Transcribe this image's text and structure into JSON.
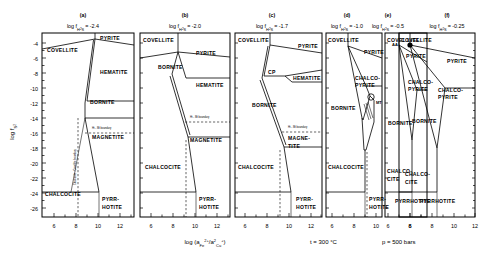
{
  "figure": {
    "axis": {
      "ylabel": "log f",
      "ylabel_sub": "S",
      "ylabel_sub2": "2",
      "ylabel_full": "log f_S2",
      "xlabel_full": "log (a_Fe2+ / a²_Cu+)",
      "xlabel_p1": "log (a",
      "xlabel_sub1": "Fe",
      "xlabel_sup1": "2+",
      "xlabel_p2": "/a",
      "xlabel_sup2": "2",
      "xlabel_sub2": "Cu",
      "xlabel_sup3": "+",
      "xlabel_p3": ")",
      "yticks": [
        "-4",
        "-6",
        "-8",
        "-10",
        "-12",
        "-14",
        "-16",
        "-18",
        "-20",
        "-22",
        "-24",
        "-26"
      ],
      "ytick_values": [
        -4,
        -6,
        -8,
        -10,
        -12,
        -14,
        -16,
        -18,
        -20,
        -22,
        -24,
        -26
      ],
      "xticks_short": [
        "6",
        "8",
        "10",
        "12"
      ],
      "xticks_long": [
        "6",
        "8",
        "10",
        "12",
        "14"
      ],
      "ylim": [
        -27,
        -2.6
      ],
      "xlim_short": [
        5,
        13
      ],
      "xlim_long": [
        5,
        15
      ]
    },
    "conditions": {
      "temperature": "t = 300 °C",
      "pressure": "p = 500 bars"
    },
    "panels": [
      {
        "id": "a",
        "tag": "(a)",
        "title_prefix": "log f",
        "title_sub": "H",
        "title_sub_n": "2",
        "title_sub_s": "S",
        "title_value": "= -2.4",
        "h2s_value": -2.4,
        "fields": [
          "COVELLITE",
          "PYRITE",
          "HEMATITE",
          "BORNITE",
          "MAGNETITE",
          "CHALCOCITE",
          "PYRRHOTITE"
        ],
        "annotations": [
          "Ht - Mt boundary",
          "Chalcocite - Covellite boundary"
        ]
      },
      {
        "id": "b",
        "tag": "(b)",
        "title_prefix": "log f",
        "title_sub": "H",
        "title_sub_n": "2",
        "title_sub_s": "S",
        "title_value": "= -2.0",
        "h2s_value": -2.0,
        "fields": [
          "COVELLITE",
          "PYRITE",
          "BORNITE",
          "HEMATITE",
          "MAGNETITE",
          "CHALCOCITE",
          "PYRRHOTITE"
        ],
        "annotations": [
          "Ht - Mt boundary"
        ]
      },
      {
        "id": "c",
        "tag": "(c)",
        "title_prefix": "log f",
        "title_sub": "H",
        "title_sub_n": "2",
        "title_sub_s": "S",
        "title_value": "= -1.7",
        "h2s_value": -1.7,
        "fields": [
          "COVELLITE",
          "PYRITE",
          "CP",
          "HEMATITE",
          "BORNITE",
          "MAGNE-TITE",
          "CHALCOCITE",
          "PYRRHOTITE"
        ],
        "annotations": [
          "Ht - Mt boundary"
        ]
      },
      {
        "id": "d",
        "tag": "(d)",
        "title_prefix": "log f",
        "title_sub": "H",
        "title_sub_n": "2",
        "title_sub_s": "S",
        "title_value": "= -1.0",
        "h2s_value": -1.0,
        "fields": [
          "COVELLITE",
          "PYRITE",
          "CHALCO-PYRITE",
          "BORNITE",
          "MT",
          "CHALCOCITE",
          "PYRRHOTITE"
        ],
        "annotations": [
          "MT"
        ]
      },
      {
        "id": "e",
        "tag": "(e)",
        "title_prefix": "log f",
        "title_sub": "H",
        "title_sub_n": "2",
        "title_sub_s": "S",
        "title_value": "= -0.5",
        "h2s_value": -0.5,
        "fields": [
          "COVELLITE",
          "PYRITE",
          "CHALCO-PYRITE",
          "BORNITE",
          "CHALCO-CITE",
          "PYRRHOTITE"
        ],
        "annotations": []
      },
      {
        "id": "f",
        "tag": "(f)",
        "title_prefix": "log f",
        "title_sub": "H",
        "title_sub_n": "2",
        "title_sub_s": "S",
        "title_value": "= -0.25",
        "h2s_value": -0.25,
        "fields": [
          "COVELLITE",
          "PYRITE",
          "CHALCO-PYRITE",
          "BORNITE",
          "CHALCO-CITE",
          "PYRRHOTITE",
          "AA"
        ],
        "annotations": [
          "AA"
        ]
      }
    ],
    "labels": {
      "covellite": "COVELLITE",
      "covellite_sp": "COVEL LITE",
      "pyrite": "PYRITE",
      "hematite": "HEMATITE",
      "bornite": "BORNITE",
      "magnetite": "MAGNETITE",
      "magne": "MAGNE-",
      "tite": "TITE",
      "chalcocite": "CHALCOCITE",
      "chalco": "CHALCO-",
      "cite": "CITE",
      "pyrrhotite": "PYRRHOTITE",
      "pyrr": "PYRR-",
      "hotite": "HOTITE",
      "chalcopyrite_l1": "CHALCO-",
      "chalcopyrite_l2": "PYRITE",
      "cp": "CP",
      "mt": "MT",
      "aa": "AA",
      "bn": "BN",
      "py": "PY"
    }
  }
}
